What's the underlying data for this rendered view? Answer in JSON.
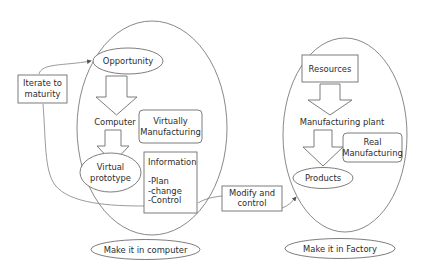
{
  "diagram": {
    "colors": {
      "stroke": "#6e6e6e",
      "text": "#2b2b2b",
      "background": "#ffffff"
    },
    "left_region": {
      "label": "Make it in computer",
      "nodes": {
        "opportunity": "Opportunity",
        "computer": "Computer",
        "virtually_manufacturing": [
          "Virtually",
          "Manufacturing"
        ],
        "virtual_prototype": [
          "Virtual",
          "prototype"
        ],
        "information": {
          "title": "Information",
          "items": [
            "-Plan",
            "-change",
            "-Control"
          ]
        }
      }
    },
    "right_region": {
      "label": "Make it in Factory",
      "nodes": {
        "resources": "Resources",
        "manufacturing_plant": "Manufacturing plant",
        "real_manufacturing": [
          "Real",
          "Manufacturing"
        ],
        "products": "Products"
      }
    },
    "feedback": {
      "iterate": [
        "Iterate to",
        "maturity"
      ],
      "modify": [
        "Modify and",
        "control"
      ]
    }
  }
}
